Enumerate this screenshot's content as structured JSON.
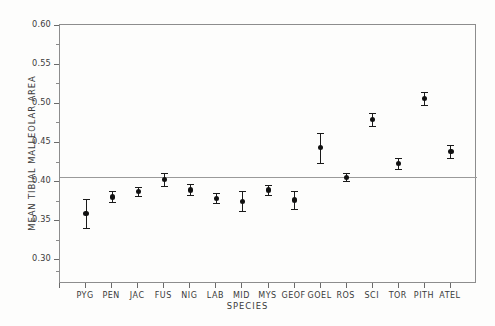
{
  "chart_data": {
    "type": "scatter",
    "title": "",
    "xlabel": "SPECIES",
    "ylabel": "MEAN TIBIAL MALLEOLAR AREA",
    "ylim": [
      0.28,
      0.6
    ],
    "ytick_labels": [
      "0.60",
      "0.55",
      "0.50",
      "0.45",
      "0.40",
      "0.35",
      "0.30"
    ],
    "ytick_values": [
      0.6,
      0.55,
      0.5,
      0.45,
      0.4,
      0.35,
      0.3
    ],
    "minor_ticks": [
      0.575,
      0.525,
      0.475,
      0.425,
      0.375,
      0.325,
      0.285
    ],
    "grid": false,
    "legend": "none",
    "error_bars": "vertical, capped",
    "reference_line": {
      "label": "grand mean",
      "value": 0.406,
      "color": "#9a9a9a"
    },
    "categories": [
      "PYG",
      "PEN",
      "JAC",
      "FUS",
      "NIG",
      "LAB",
      "MID",
      "MYS",
      "GEOF",
      "GOEL",
      "ROS",
      "SCI",
      "TOR",
      "PITH",
      "ATEL"
    ],
    "values": [
      0.36,
      0.381,
      0.388,
      0.403,
      0.39,
      0.379,
      0.375,
      0.39,
      0.377,
      0.444,
      0.406,
      0.48,
      0.424,
      0.507,
      0.439
    ],
    "err_low": [
      0.341,
      0.374,
      0.382,
      0.395,
      0.384,
      0.373,
      0.363,
      0.384,
      0.366,
      0.425,
      0.401,
      0.472,
      0.417,
      0.499,
      0.431
    ],
    "err_high": [
      0.378,
      0.388,
      0.394,
      0.411,
      0.397,
      0.386,
      0.388,
      0.396,
      0.389,
      0.463,
      0.412,
      0.488,
      0.431,
      0.515,
      0.448
    ],
    "point_color": "#111111"
  },
  "axis": {
    "y_title": "MEAN TIBIAL MALLEOLAR AREA",
    "x_title": "SPECIES"
  }
}
